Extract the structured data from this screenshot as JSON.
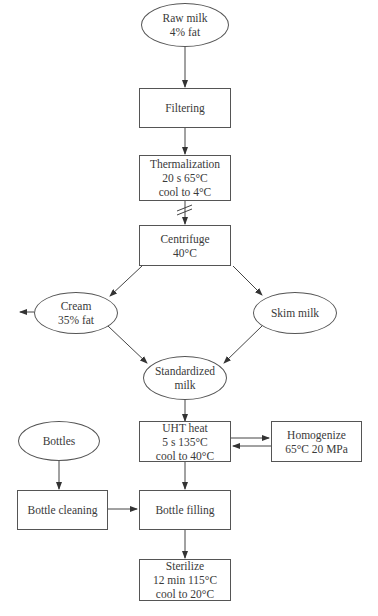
{
  "nodes": {
    "raw_milk": {
      "shape": "ellipse",
      "lines": [
        "Raw milk",
        "4% fat"
      ]
    },
    "filtering": {
      "shape": "box",
      "lines": [
        "Filtering"
      ]
    },
    "thermalization": {
      "shape": "box",
      "lines": [
        "Thermalization",
        "20 s 65°C",
        "cool to 4°C"
      ]
    },
    "centrifuge": {
      "shape": "box",
      "lines": [
        "Centrifuge",
        "40°C"
      ]
    },
    "cream": {
      "shape": "ellipse",
      "lines": [
        "Cream",
        "35% fat"
      ]
    },
    "skim_milk": {
      "shape": "ellipse",
      "lines": [
        "Skim milk"
      ]
    },
    "standardized_milk": {
      "shape": "ellipse",
      "lines": [
        "Standardized",
        "milk"
      ]
    },
    "uht_heat": {
      "shape": "box",
      "lines": [
        "UHT heat",
        "5 s 135°C",
        "cool to 40°C"
      ]
    },
    "homogenize": {
      "shape": "box",
      "lines": [
        "Homogenize",
        "65°C 20 MPa"
      ]
    },
    "bottles": {
      "shape": "ellipse",
      "lines": [
        "Bottles"
      ]
    },
    "bottle_cleaning": {
      "shape": "box",
      "lines": [
        "Bottle cleaning"
      ]
    },
    "bottle_filling": {
      "shape": "box",
      "lines": [
        "Bottle filling"
      ]
    },
    "sterilize": {
      "shape": "box",
      "lines": [
        "Sterilize",
        "12 min 115°C",
        "cool to 20°C"
      ]
    }
  },
  "edges": [
    {
      "from": "raw_milk",
      "to": "filtering"
    },
    {
      "from": "filtering",
      "to": "thermalization"
    },
    {
      "from": "thermalization",
      "to": "centrifuge",
      "note": "time break"
    },
    {
      "from": "centrifuge",
      "to": "cream"
    },
    {
      "from": "centrifuge",
      "to": "skim_milk"
    },
    {
      "from": "cream",
      "to": "out",
      "note": "excess cream exits left"
    },
    {
      "from": "cream",
      "to": "standardized_milk"
    },
    {
      "from": "skim_milk",
      "to": "standardized_milk"
    },
    {
      "from": "standardized_milk",
      "to": "uht_heat"
    },
    {
      "from": "uht_heat",
      "to": "homogenize"
    },
    {
      "from": "homogenize",
      "to": "uht_heat"
    },
    {
      "from": "uht_heat",
      "to": "bottle_filling"
    },
    {
      "from": "bottles",
      "to": "bottle_cleaning"
    },
    {
      "from": "bottle_cleaning",
      "to": "bottle_filling"
    },
    {
      "from": "bottle_filling",
      "to": "sterilize"
    }
  ]
}
